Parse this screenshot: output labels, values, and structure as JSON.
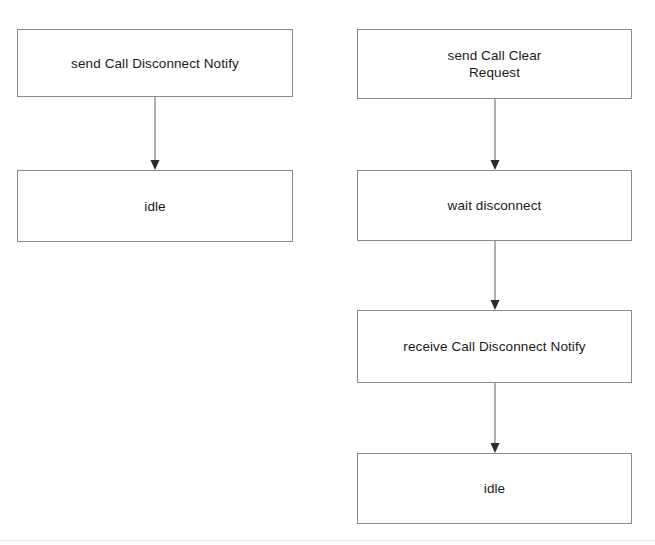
{
  "diagram": {
    "background_color": "#ffffff",
    "node_border_color": "#8a8a8a",
    "node_fill_color": "#ffffff",
    "text_color": "#1a1a1a",
    "edge_color": "#6e6e6e",
    "arrowhead_color": "#2b2b2b",
    "columns": [
      {
        "id": "left-column",
        "name": "left-flow",
        "nodes": [
          {
            "id": "left-node-1",
            "name": "send-call-disconnect-notify",
            "label": "send Call Disconnect Notify",
            "x": 17,
            "y": 29,
            "width": 276,
            "height": 68
          },
          {
            "id": "left-node-2",
            "name": "idle-left",
            "label": "idle",
            "x": 17,
            "y": 170,
            "width": 276,
            "height": 72
          }
        ],
        "edges": [
          {
            "id": "left-edge-1",
            "name": "edge-send-disconnect-to-idle",
            "from": "left-node-1",
            "to": "left-node-2",
            "x": 155,
            "y_start": 97,
            "y_end": 170
          }
        ]
      },
      {
        "id": "right-column",
        "name": "right-flow",
        "nodes": [
          {
            "id": "right-node-1",
            "name": "send-call-clear-request",
            "label": "send Call Clear\nRequest",
            "x": 357,
            "y": 29,
            "width": 275,
            "height": 70
          },
          {
            "id": "right-node-2",
            "name": "wait-disconnect",
            "label": "wait disconnect",
            "x": 357,
            "y": 170,
            "width": 275,
            "height": 71
          },
          {
            "id": "right-node-3",
            "name": "receive-call-disconnect-notify",
            "label": "receive Call Disconnect Notify",
            "x": 357,
            "y": 310,
            "width": 275,
            "height": 73
          },
          {
            "id": "right-node-4",
            "name": "idle-right",
            "label": "idle",
            "x": 357,
            "y": 453,
            "width": 275,
            "height": 71
          }
        ],
        "edges": [
          {
            "id": "right-edge-1",
            "name": "edge-clear-request-to-wait-disconnect",
            "from": "right-node-1",
            "to": "right-node-2",
            "x": 495,
            "y_start": 99,
            "y_end": 170
          },
          {
            "id": "right-edge-2",
            "name": "edge-wait-disconnect-to-receive-notify",
            "from": "right-node-2",
            "to": "right-node-3",
            "x": 495,
            "y_start": 241,
            "y_end": 310
          },
          {
            "id": "right-edge-3",
            "name": "edge-receive-notify-to-idle",
            "from": "right-node-3",
            "to": "right-node-4",
            "x": 495,
            "y_start": 383,
            "y_end": 453
          }
        ]
      }
    ]
  }
}
